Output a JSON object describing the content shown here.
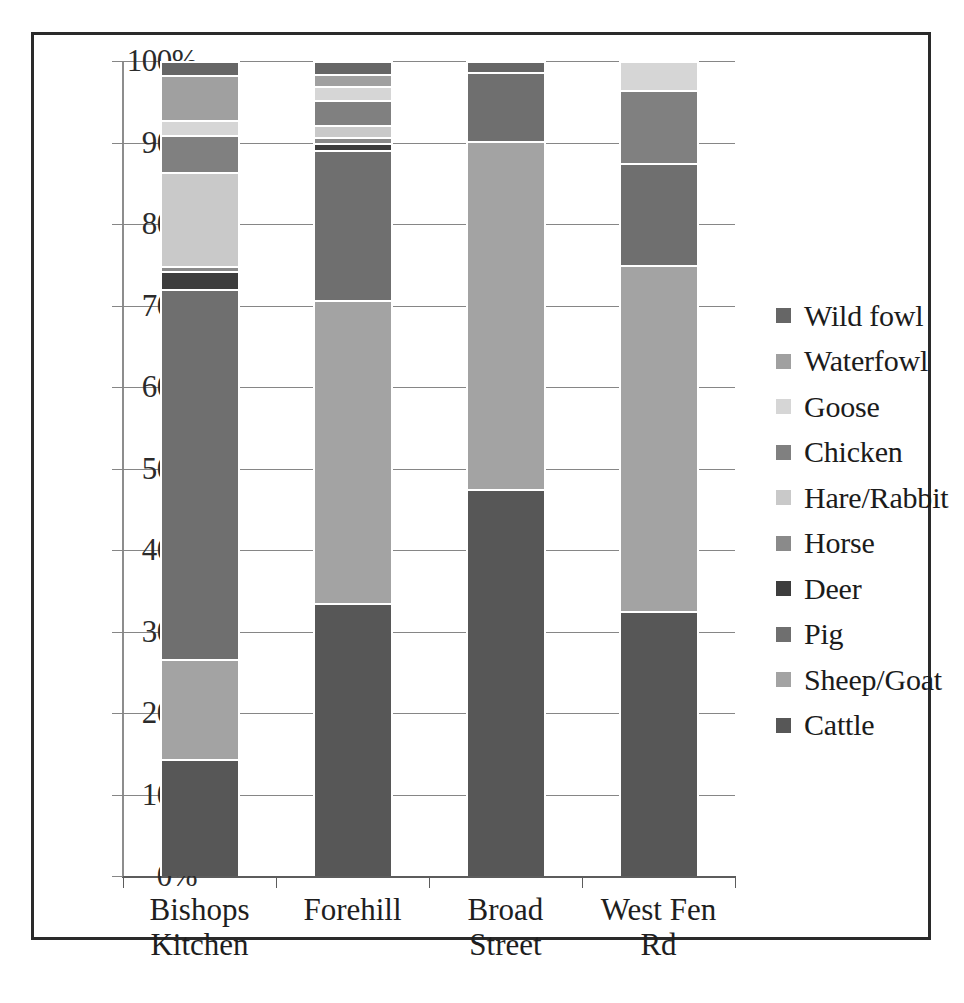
{
  "chart_data": {
    "type": "bar",
    "subtype": "stacked-100-percent",
    "title": "",
    "xlabel": "",
    "ylabel": "",
    "ylim": [
      0,
      100
    ],
    "y_tick_labels": [
      "100%",
      "90%",
      "80%",
      "70%",
      "60%",
      "50%",
      "40%",
      "30%",
      "20%",
      "10%",
      "0%"
    ],
    "y_tick_values": [
      100,
      90,
      80,
      70,
      60,
      50,
      40,
      30,
      20,
      10,
      0
    ],
    "grid": "horizontal",
    "legend_position": "right",
    "categories": [
      "Bishops Kitchen",
      "Forehill",
      "Broad Street",
      "West Fen Rd"
    ],
    "stack_order_bottom_to_top": [
      "Cattle",
      "Sheep/Goat",
      "Pig",
      "Deer",
      "Horse",
      "Hare/Rabbit",
      "Chicken",
      "Goose",
      "Waterfowl",
      "Wild fowl"
    ],
    "series": [
      {
        "name": "Cattle",
        "color": "#575757",
        "values": [
          14.3,
          33.5,
          47.5,
          32.5
        ]
      },
      {
        "name": "Sheep/Goat",
        "color": "#a3a3a3",
        "values": [
          12.3,
          37.2,
          42.7,
          42.5
        ]
      },
      {
        "name": "Pig",
        "color": "#6f6f6f",
        "values": [
          45.4,
          18.4,
          8.4,
          12.5
        ]
      },
      {
        "name": "Deer",
        "color": "#3d3d3d",
        "values": [
          2.2,
          0.9,
          0.0,
          0.0
        ]
      },
      {
        "name": "Horse",
        "color": "#8a8a8a",
        "values": [
          0.7,
          0.7,
          0.0,
          0.0
        ]
      },
      {
        "name": "Hare/Rabbit",
        "color": "#c9c9c9",
        "values": [
          11.5,
          1.5,
          0.0,
          0.0
        ]
      },
      {
        "name": "Chicken",
        "color": "#808080",
        "values": [
          4.5,
          3.0,
          0.0,
          9.0
        ]
      },
      {
        "name": "Goose",
        "color": "#d6d6d6",
        "values": [
          1.9,
          1.7,
          0.0,
          3.5
        ]
      },
      {
        "name": "Waterfowl",
        "color": "#a0a0a0",
        "values": [
          5.5,
          1.5,
          0.0,
          0.0
        ]
      },
      {
        "name": "Wild fowl",
        "color": "#666666",
        "values": [
          1.7,
          1.6,
          1.4,
          0.0
        ]
      }
    ]
  },
  "legend": {
    "items": [
      {
        "label": "Wild fowl",
        "color": "#666666"
      },
      {
        "label": "Waterfowl",
        "color": "#a0a0a0"
      },
      {
        "label": "Goose",
        "color": "#d6d6d6"
      },
      {
        "label": "Chicken",
        "color": "#808080"
      },
      {
        "label": "Hare/Rabbit",
        "color": "#c9c9c9"
      },
      {
        "label": "Horse",
        "color": "#8a8a8a"
      },
      {
        "label": "Deer",
        "color": "#3d3d3d"
      },
      {
        "label": "Pig",
        "color": "#6f6f6f"
      },
      {
        "label": "Sheep/Goat",
        "color": "#a3a3a3"
      },
      {
        "label": "Cattle",
        "color": "#575757"
      }
    ]
  },
  "axis": {
    "category_labels": [
      "Bishops\nKitchen",
      "Forehill",
      "Broad Street",
      "West Fen Rd"
    ]
  },
  "colors": {
    "frame": "#2a2a2a",
    "gridline": "#868686",
    "axis": "#5c5c5c",
    "segment_border": "#ffffff",
    "background": "#ffffff",
    "text": "#1e1e1e"
  }
}
